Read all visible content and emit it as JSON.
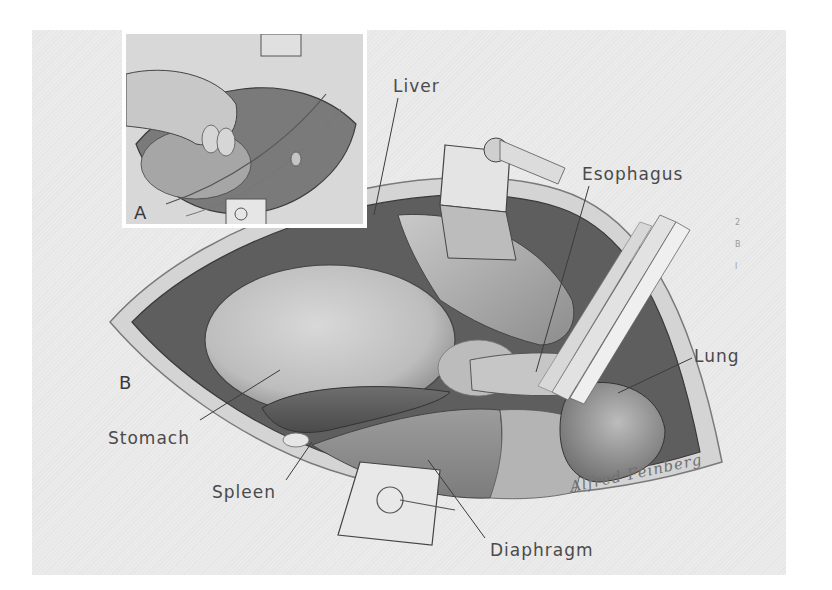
{
  "figure": {
    "type": "anatomical-surgical-illustration",
    "style": "grayscale pencil drawing",
    "panels": [
      {
        "id": "A",
        "label": "A",
        "description": "inset: hand/fingers exploring through retracted incision"
      },
      {
        "id": "B",
        "label": "B",
        "description": "main view: opened thoracoabdominal field with retractors"
      }
    ],
    "labels": {
      "liver": "Liver",
      "esophagus": "Esophagus",
      "lung": "Lung",
      "stomach": "Stomach",
      "spleen": "Spleen",
      "diaphragm": "Diaphragm"
    },
    "signature": "Alfred Feinberg",
    "margin_marks": [
      "2",
      "B",
      "l"
    ],
    "colors": {
      "background": "#ffffff",
      "plate": "#ebebeb",
      "label_text": "#4a4a4a",
      "leader_line": "#3c3c3c",
      "cavity_dark": "#5e5e5e",
      "organ_mid": "#a8a8a8",
      "organ_light": "#cfcfcf"
    }
  }
}
